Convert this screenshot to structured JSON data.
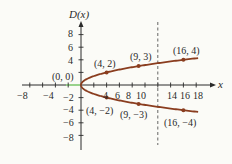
{
  "chart_data": {
    "type": "line",
    "title": "",
    "ylabel": "D(x)",
    "xlabel": "x",
    "xlim": [
      -9,
      19
    ],
    "ylim": [
      -10,
      10
    ],
    "grid": false,
    "x_ticks": [
      -8,
      -4,
      4,
      6,
      8,
      10,
      14,
      16,
      18
    ],
    "x_tick_marks": [
      -8,
      -6,
      -4,
      -2,
      2,
      4,
      6,
      8,
      10,
      12,
      14,
      16,
      18
    ],
    "y_ticks": [
      8,
      6,
      4,
      -2,
      -4,
      -6,
      -8
    ],
    "y_tick_marks": [
      8,
      6,
      4,
      2,
      -2,
      -4,
      -6,
      -8
    ],
    "series": [
      {
        "name": "upper branch y = sqrt(x)",
        "x": [
          0,
          1,
          4,
          9,
          16,
          18
        ],
        "y": [
          0,
          1,
          2,
          3,
          4,
          4.24
        ]
      },
      {
        "name": "lower branch y = -sqrt(x)",
        "x": [
          0,
          1,
          4,
          9,
          16,
          18
        ],
        "y": [
          0,
          -1,
          -2,
          -3,
          -4,
          -4.24
        ]
      }
    ],
    "points": [
      {
        "label": "(0, 0)",
        "x": 0,
        "y": 0
      },
      {
        "label": "(4, 2)",
        "x": 4,
        "y": 2
      },
      {
        "label": "(9, 3)",
        "x": 9,
        "y": 3
      },
      {
        "label": "(16, 4)",
        "x": 16,
        "y": 4
      },
      {
        "label": "(4, −2)",
        "x": 4,
        "y": -2
      },
      {
        "label": "(9, −3)",
        "x": 9,
        "y": -3
      },
      {
        "label": "(16, −4)",
        "x": 16,
        "y": -4
      }
    ],
    "annotations": [
      {
        "type": "dashed-vertical-line",
        "x": 12
      }
    ]
  },
  "labels": {
    "y_axis": "D(x)",
    "x_axis": "x",
    "x_tick_labels": [
      "−8",
      "−4",
      "4",
      "6",
      "8",
      "10",
      "14",
      "16",
      "18"
    ],
    "y_tick_labels": [
      "8",
      "6",
      "4",
      "−2",
      "−4",
      "−6",
      "−8"
    ],
    "point_labels": [
      "(0, 0)",
      "(4, 2)",
      "(9, 3)",
      "(16, 4)",
      "(4, −2)",
      "(9, −3)",
      "(16, −4)"
    ]
  },
  "colors": {
    "curve": "#8a3d1f",
    "axis": "#2a2a2a",
    "highlight": "#9be38c",
    "dashed": "#555555"
  }
}
